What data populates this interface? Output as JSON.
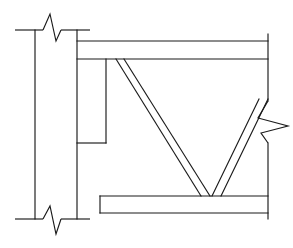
{
  "drawing": {
    "type": "structural-steel-connection-detail",
    "view": "elevation",
    "title": "",
    "background_color": "#ffffff",
    "line_color": "#1a1a1a",
    "canvas": {
      "width": 293,
      "height": 248
    },
    "members": {
      "column": {
        "name": "column",
        "orientation": "vertical",
        "left_face_x": 35,
        "right_face_x": 77,
        "top_y": 30,
        "bottom_y": 219,
        "label": ""
      },
      "top_beam": {
        "name": "top-beam",
        "orientation": "horizontal",
        "left_x": 77,
        "right_x": 268,
        "top_y": 41,
        "bottom_y": 59,
        "label": ""
      },
      "bottom_beam": {
        "name": "bottom-beam",
        "orientation": "horizontal",
        "left_x": 100,
        "right_x": 268,
        "top_y": 196,
        "bottom_y": 213,
        "label": ""
      },
      "gusset_plate": {
        "name": "gusset-plate",
        "left_x": 77,
        "right_x": 106,
        "top_y": 59,
        "bottom_y": 143,
        "label": ""
      },
      "left_diagonal_brace": {
        "name": "left-diagonal-brace",
        "top_start_x": 116,
        "top_end_x": 124,
        "top_y": 59,
        "bottom_start_x": 201,
        "bottom_end_x": 210,
        "bottom_y": 196,
        "label": ""
      },
      "right_diagonal_brace": {
        "name": "right-diagonal-brace",
        "bottom_start_x": 212,
        "bottom_end_x": 221,
        "bottom_y": 196,
        "top_start_x": 258,
        "top_end_x": 268,
        "top_y": 101,
        "label": ""
      },
      "right_edge_upper": {
        "name": "right-edge-upper",
        "x": 268,
        "top_y": 34,
        "bottom_y": 101
      },
      "right_edge_lower": {
        "name": "right-edge-lower",
        "x": 268,
        "top_y": 143,
        "bottom_y": 219
      }
    },
    "break_symbols": [
      {
        "name": "break-symbol-column-top",
        "placement": "top",
        "orientation": "horizontal-line-with-zigzag",
        "line_y": 30,
        "line_x1": 15,
        "line_x2": 90,
        "zigzag_center_x": 52,
        "direction": "up"
      },
      {
        "name": "break-symbol-column-bottom",
        "placement": "bottom",
        "orientation": "horizontal-line-with-zigzag",
        "line_y": 219,
        "line_x1": 15,
        "line_x2": 90,
        "zigzag_center_x": 52,
        "direction": "down"
      },
      {
        "name": "break-symbol-right-member",
        "placement": "right",
        "orientation": "vertical-line-with-zigzag",
        "line_x": 268,
        "line_y1": 101,
        "line_y2": 143,
        "zigzag_center_y": 124,
        "direction": "right"
      }
    ],
    "annotations": [],
    "dimensions": [],
    "notes": []
  }
}
